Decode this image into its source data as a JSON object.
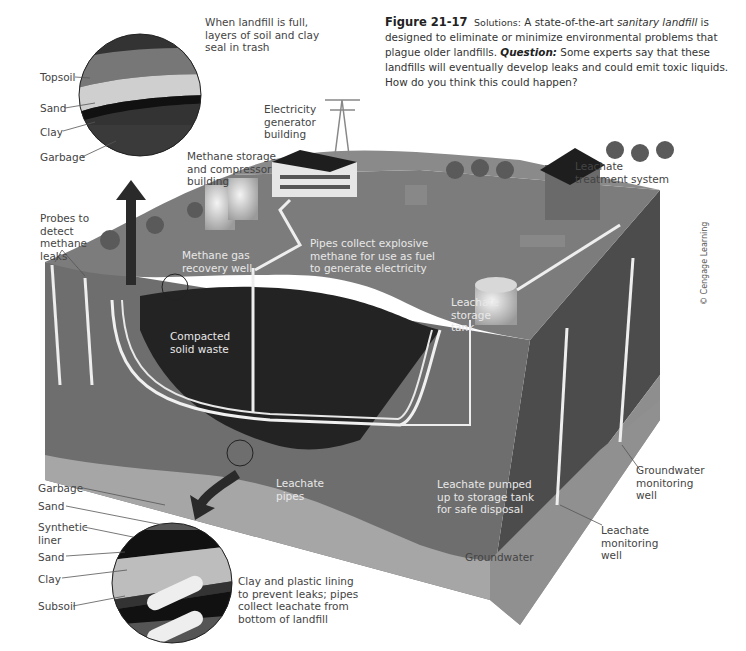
{
  "caption": {
    "figure_number": "Figure 21-17",
    "solutions_prefix": "Solutions:",
    "text_before_term": " A state-of-the-art ",
    "term": "sanitary landfill",
    "text_after_term": " is designed to eliminate or minimize environmental problems that plague older landfills.",
    "question_label": "Question:",
    "question_text": " Some experts say that these landfills will eventually develop leaks and could emit toxic liquids. How do you think this could happen?"
  },
  "credit": "© Cengage Learning",
  "top_inset": {
    "note": "When landfill is full,\nlayers of soil and clay\nseal in trash",
    "layers": [
      "Topsoil",
      "Sand",
      "Clay",
      "Garbage"
    ]
  },
  "bottom_inset": {
    "note": "Clay and plastic lining\nto prevent leaks; pipes\ncollect leachate from\nbottom of landfill",
    "layers": [
      "Garbage",
      "Sand",
      "Synthetic\nliner",
      "Sand",
      "Clay",
      "Subsoil"
    ]
  },
  "labels": {
    "electricity_building": "Electricity\ngenerator\nbuilding",
    "methane_storage": "Methane storage\nand compressor\nbuilding",
    "leachate_treatment": "Leachate\ntreatment system",
    "probes": "Probes to\ndetect\nmethane\nleaks",
    "methane_well": "Methane gas\nrecovery well",
    "pipes_collect": "Pipes collect explosive\nmethane for use as fuel\nto generate electricity",
    "compacted_waste": "Compacted\nsolid waste",
    "leachate_tank": "Leachate\nstorage\ntank",
    "leachate_pipes": "Leachate\npipes",
    "leachate_pumped": "Leachate pumped\nup to storage tank\nfor safe disposal",
    "groundwater_well": "Groundwater\nmonitoring\nwell",
    "leachate_well": "Leachate\nmonitoring\nwell",
    "groundwater": "Groundwater"
  },
  "colors": {
    "surface": "#7a7a7a",
    "waste": "#262626",
    "soil": "#6a6a6a",
    "groundwater": "#a8a8a8",
    "side_dark": "#4a4a4a",
    "pipe": "#f2f2f2"
  }
}
